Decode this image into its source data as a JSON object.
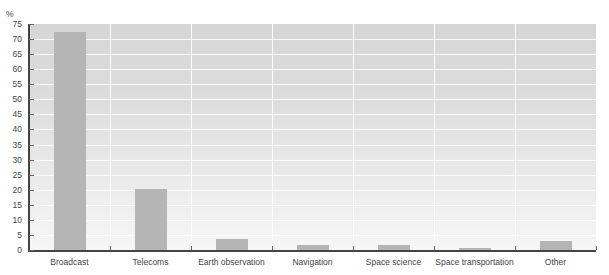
{
  "chart_data": {
    "type": "bar",
    "title": "",
    "xlabel": "",
    "ylabel": "%",
    "ylim": [
      0,
      75
    ],
    "yticks": [
      0,
      5,
      10,
      15,
      20,
      25,
      30,
      35,
      40,
      45,
      50,
      55,
      60,
      65,
      70,
      75
    ],
    "grid": true,
    "legend": null,
    "categories": [
      "Broadcast",
      "Telecoms",
      "Earth observation",
      "Navigation",
      "Space science",
      "Space transportation",
      "Other"
    ],
    "values": [
      72.5,
      20.3,
      3.5,
      1.5,
      1.7,
      0.7,
      3.0
    ],
    "bar_color": "#b5b5b5",
    "background": "vertical gradient gray to white"
  },
  "labels": {
    "y_unit": "%",
    "y_ticks": [
      "0",
      "5",
      "10",
      "15",
      "20",
      "25",
      "30",
      "35",
      "40",
      "45",
      "50",
      "55",
      "60",
      "65",
      "70",
      "75"
    ],
    "categories": [
      "Broadcast",
      "Telecoms",
      "Earth observation",
      "Navigation",
      "Space science",
      "Space transportation",
      "Other"
    ]
  }
}
